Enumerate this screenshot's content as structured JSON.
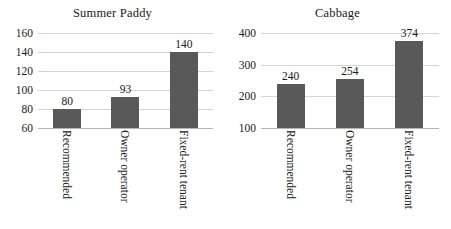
{
  "chart_data": [
    {
      "type": "bar",
      "title": "Summer Paddy",
      "xlabel": "",
      "ylabel": "",
      "categories": [
        "Recommended",
        "Owner operator",
        "Fixed-rent tenant"
      ],
      "values": [
        80,
        93,
        140
      ],
      "value_labels": [
        "80",
        "93",
        "140"
      ],
      "yticks": [
        160,
        140,
        120,
        100,
        80,
        60
      ],
      "ytick_labels": [
        "160",
        "140",
        "120",
        "100",
        "80",
        "60"
      ],
      "ylim": [
        60,
        160
      ],
      "grid": true,
      "legend": false,
      "bar_color": "#595959",
      "grid_color": "#d4d4d4"
    },
    {
      "type": "bar",
      "title": "Cabbage",
      "xlabel": "",
      "ylabel": "",
      "categories": [
        "Recommended",
        "Owner operator",
        "Fixed-rent tenant"
      ],
      "values": [
        240,
        254,
        374
      ],
      "value_labels": [
        "240",
        "254",
        "374"
      ],
      "yticks": [
        400,
        300,
        200,
        100
      ],
      "ytick_labels": [
        "400",
        "300",
        "200",
        "100"
      ],
      "ylim": [
        100,
        400
      ],
      "grid": true,
      "legend": false,
      "bar_color": "#595959",
      "grid_color": "#d4d4d4"
    }
  ]
}
